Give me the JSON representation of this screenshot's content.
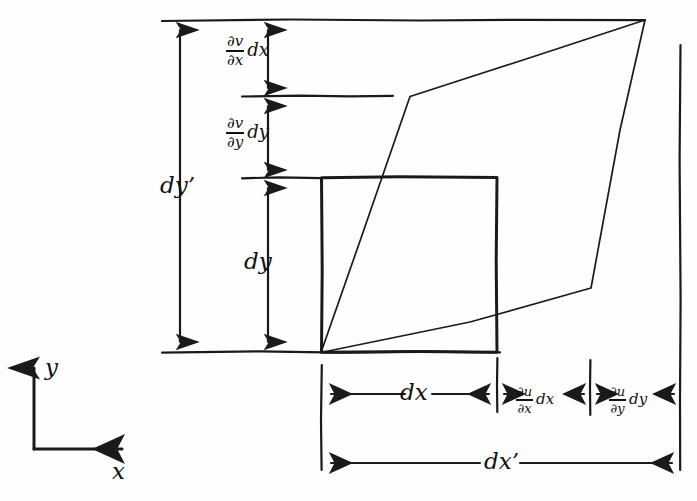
{
  "figure": {
    "ink_color": "#1a1a1a",
    "background_color": "#fefefe"
  },
  "axes": {
    "y_label": "y",
    "x_label": "x"
  },
  "vertical_dimensions": [
    {
      "name": "dv-dx-dx",
      "numerator": "∂v",
      "denominator": "∂x",
      "multiplier": "dx",
      "span_top": 20,
      "span_bottom": 96
    },
    {
      "name": "dv-dy-dy",
      "numerator": "∂v",
      "denominator": "∂y",
      "multiplier": "dy",
      "span_top": 96,
      "span_bottom": 178
    },
    {
      "name": "dy",
      "label": "dy",
      "span_top": 178,
      "span_bottom": 352
    },
    {
      "name": "dy-prime",
      "label": "dy’",
      "span_top": 20,
      "span_bottom": 352
    }
  ],
  "horizontal_dimensions": [
    {
      "name": "dx",
      "label": "dx",
      "span_left": 321,
      "span_right": 497
    },
    {
      "name": "du-dx-dx",
      "numerator": "∂u",
      "denominator": "∂x",
      "multiplier": "dx",
      "span_left": 497,
      "span_right": 590
    },
    {
      "name": "du-dy-dy",
      "numerator": "∂u",
      "denominator": "∂y",
      "multiplier": "dy",
      "span_left": 590,
      "span_right": 680
    },
    {
      "name": "dx-prime",
      "label": "dx’",
      "span_left": 321,
      "span_right": 680
    }
  ],
  "shapes": {
    "undeformed_square": {
      "name": "undeformed-element",
      "x": 321,
      "y": 177,
      "width": 176,
      "height": 175
    },
    "deformed_quad": {
      "name": "deformed-element",
      "points": "321,352 410,96 645,20 590,288"
    }
  },
  "reference_lines": {
    "top": {
      "y": 20,
      "x1": 162,
      "x2": 645
    },
    "second": {
      "y": 96,
      "x1": 242,
      "x2": 393
    },
    "third": {
      "y": 178,
      "x1": 242,
      "x2": 321
    },
    "baseline": {
      "y": 352,
      "x1": 162,
      "x2": 500
    },
    "right_edge": {
      "x": 680,
      "y1": 45,
      "y2": 470
    }
  }
}
